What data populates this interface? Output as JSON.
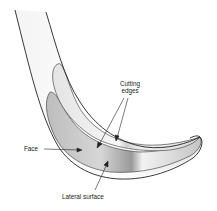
{
  "diagram": {
    "labels": {
      "cutting_edges_line1": "Cutting",
      "cutting_edges_line2": "edges",
      "face": "Face",
      "lateral_surface": "Lateral surface"
    },
    "colors": {
      "outline": "#2a2a2a",
      "face_fill": "#e6e6e6",
      "lateral_fill": "#c8c8c8",
      "background": "#ffffff"
    }
  }
}
